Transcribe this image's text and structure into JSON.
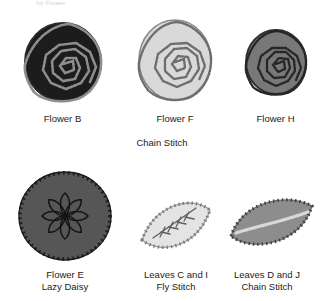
{
  "page": {
    "background_color": "#ffffff",
    "cropped_header_sliver": "for Flower"
  },
  "rows": [
    {
      "group_caption": "Chain Stitch",
      "items": [
        {
          "id": "flower-b",
          "shape": "circle",
          "motif": "spiral-rose",
          "label_line1": "Flower B",
          "label_line2": "",
          "fill_color": "#1c1c1c",
          "stitch_color": "#8e8e8e",
          "edge_color": "#2a2a2a"
        },
        {
          "id": "flower-f",
          "shape": "circle",
          "motif": "spiral-rose",
          "label_line1": "Flower F",
          "label_line2": "",
          "fill_color": "#d9d9d9",
          "stitch_color": "#6e6e6e",
          "edge_color": "#8a8a8a"
        },
        {
          "id": "flower-h",
          "shape": "circle",
          "motif": "spiral-rose",
          "label_line1": "Flower H",
          "label_line2": "",
          "fill_color": "#787878",
          "stitch_color": "#262626",
          "edge_color": "#2e2e2e"
        }
      ]
    },
    {
      "group_caption": "",
      "items": [
        {
          "id": "flower-e",
          "shape": "circle",
          "motif": "lazy-daisy",
          "petal_count": 8,
          "label_line1": "Flower E",
          "label_line2": "Lazy Daisy",
          "fill_color": "#565656",
          "stitch_color": "#1a1a1a",
          "edge_color": "#1f1f1f"
        },
        {
          "id": "leaves-c-and-i",
          "shape": "leaf",
          "motif": "fly-stitch-vein",
          "label_line1": "Leaves C and I",
          "label_line2": "Fly Stitch",
          "fill_color": "#e4e4e4",
          "stitch_color": "#7b7b7b",
          "edge_color": "#9a9a9a"
        },
        {
          "id": "leaves-d-and-j",
          "shape": "leaf",
          "motif": "chain-stitch-vein",
          "label_line1": "Leaves D and J",
          "label_line2": "Chain Stitch",
          "fill_color": "#8d8d8d",
          "stitch_color": "#d8d8d8",
          "edge_color": "#6b6b6b"
        }
      ]
    }
  ]
}
